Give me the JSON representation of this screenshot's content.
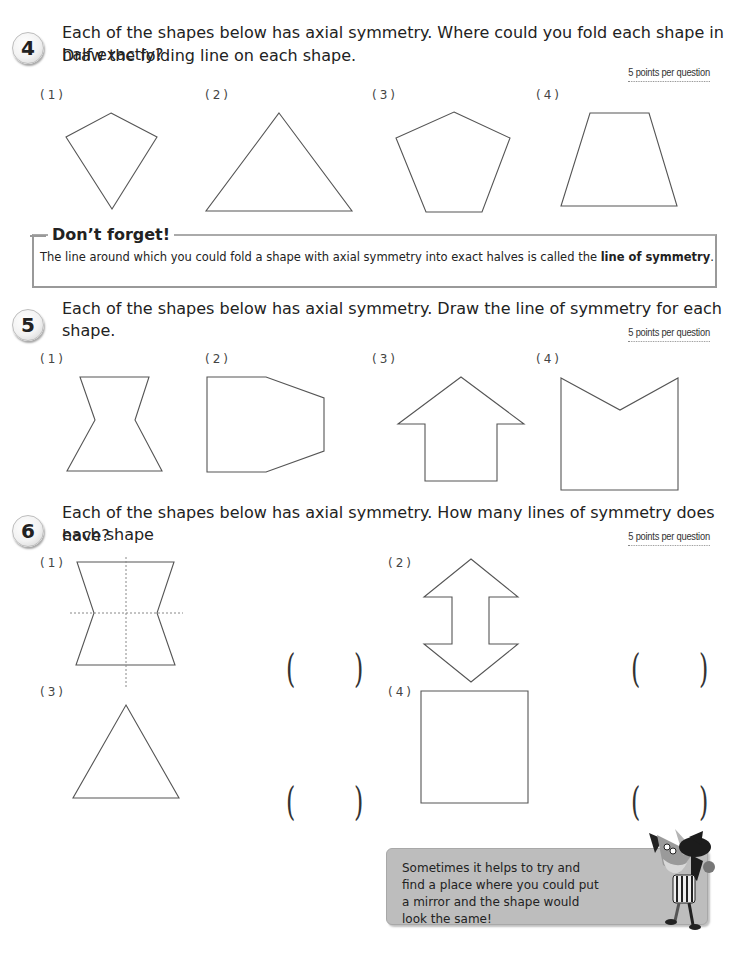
{
  "questions": [
    {
      "number": "4",
      "text_line1": "Each of the shapes below has axial symmetry. Where could you fold each shape in half exactly?",
      "text_line2": "Draw the folding line on each shape.",
      "points": "5 points per question",
      "items": [
        {
          "label": "(1)",
          "shape": "kite"
        },
        {
          "label": "(2)",
          "shape": "triangle"
        },
        {
          "label": "(3)",
          "shape": "pentagon"
        },
        {
          "label": "(4)",
          "shape": "trapezoid"
        }
      ]
    },
    {
      "number": "5",
      "text_line1": "Each of the shapes below has axial symmetry. Draw the line of symmetry for each shape.",
      "points": "5 points per question",
      "items": [
        {
          "label": "(1)",
          "shape": "hourglass"
        },
        {
          "label": "(2)",
          "shape": "truncated-pentagon"
        },
        {
          "label": "(3)",
          "shape": "arrow-up"
        },
        {
          "label": "(4)",
          "shape": "notched-rectangle"
        }
      ]
    },
    {
      "number": "6",
      "text_line1": "Each of the shapes below has axial symmetry. How many lines of symmetry does each shape",
      "text_line2": "have?",
      "points": "5 points per question",
      "items": [
        {
          "label": "(1)",
          "shape": "hourglass-with-dotted-lines",
          "answer_open": "(",
          "answer_close": ")"
        },
        {
          "label": "(2)",
          "shape": "double-arrow",
          "answer_open": "(",
          "answer_close": ")"
        },
        {
          "label": "(3)",
          "shape": "equilateral-triangle",
          "answer_open": "(",
          "answer_close": ")"
        },
        {
          "label": "(4)",
          "shape": "square",
          "answer_open": "(",
          "answer_close": ")"
        }
      ]
    }
  ],
  "dont_forget": {
    "title": "Don’t forget!",
    "text_before": "The line around which you could fold a shape with axial symmetry into exact halves is called the ",
    "text_bold": "line of symmetry",
    "text_after": "."
  },
  "tip": {
    "text": "Sometimes it helps to try and find a place where you could put a mirror and the shape would look the same!",
    "mascot": "fox-mascot"
  },
  "colors": {
    "stroke": "#555555",
    "tip_bg": "#bdbdbd",
    "border": "#999999"
  }
}
